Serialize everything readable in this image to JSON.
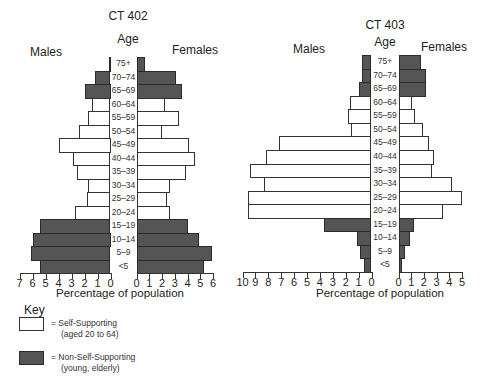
{
  "chart_data": [
    {
      "type": "bar",
      "subtype": "population-pyramid",
      "title": "CT 402",
      "center_label": "Age",
      "left_label": "Males",
      "right_label": "Females",
      "xlabel": "Percentage of population",
      "categories": [
        "75+",
        "70–74",
        "65–69",
        "60–64",
        "55–59",
        "50–54",
        "45–49",
        "40–44",
        "35–39",
        "30–34",
        "25–29",
        "20–24",
        "15–19",
        "10–14",
        "5–9",
        "<5"
      ],
      "category_type": [
        "non",
        "non",
        "non",
        "self",
        "self",
        "self",
        "self",
        "self",
        "self",
        "self",
        "self",
        "self",
        "non",
        "non",
        "non",
        "non"
      ],
      "series": [
        {
          "name": "Males",
          "values": [
            0.1,
            1.2,
            2.0,
            1.4,
            1.7,
            2.4,
            4.0,
            2.9,
            2.6,
            1.7,
            1.8,
            2.7,
            5.4,
            6.0,
            6.1,
            5.4
          ]
        },
        {
          "name": "Females",
          "values": [
            0.7,
            3.1,
            3.6,
            2.2,
            3.3,
            2.0,
            4.1,
            4.6,
            3.9,
            2.6,
            2.4,
            2.6,
            4.0,
            4.9,
            5.9,
            5.3
          ]
        }
      ],
      "left_axis": {
        "range": [
          7,
          0
        ],
        "ticks": [
          "7",
          "6",
          "5",
          "4",
          "3",
          "2",
          "1",
          "0"
        ]
      },
      "right_axis": {
        "range": [
          0,
          6
        ],
        "ticks": [
          "0",
          "1",
          "2",
          "3",
          "4",
          "5",
          "6"
        ]
      },
      "grid": false
    },
    {
      "type": "bar",
      "subtype": "population-pyramid",
      "title": "CT 403",
      "center_label": "Age",
      "left_label": "Males",
      "right_label": "Females",
      "xlabel": "Percentage of population",
      "categories": [
        "75+",
        "70–74",
        "65–69",
        "60–64",
        "55–59",
        "50–54",
        "45–49",
        "40–44",
        "35–39",
        "30–34",
        "25–29",
        "20–24",
        "15–19",
        "10–14",
        "5–9",
        "<5"
      ],
      "category_type": [
        "non",
        "non",
        "non",
        "self",
        "self",
        "self",
        "self",
        "self",
        "self",
        "self",
        "self",
        "self",
        "non",
        "non",
        "non",
        "non"
      ],
      "series": [
        {
          "name": "Males",
          "values": [
            0.7,
            0.7,
            1.0,
            1.7,
            1.8,
            1.6,
            7.2,
            8.2,
            9.4,
            8.3,
            9.6,
            9.6,
            3.7,
            1.1,
            0.9,
            0.6
          ]
        },
        {
          "name": "Females",
          "values": [
            1.8,
            2.2,
            2.2,
            1.1,
            1.3,
            1.9,
            2.4,
            2.8,
            2.6,
            4.2,
            5.0,
            3.5,
            1.2,
            0.9,
            0.5,
            0.3
          ]
        }
      ],
      "left_axis": {
        "range": [
          10,
          0
        ],
        "ticks": [
          "10",
          "9",
          "8",
          "7",
          "6",
          "5",
          "4",
          "3",
          "2",
          "1",
          "0"
        ]
      },
      "right_axis": {
        "range": [
          0,
          5
        ],
        "ticks": [
          "0",
          "1",
          "2",
          "3",
          "4",
          "5"
        ]
      },
      "grid": false
    }
  ],
  "key": {
    "title": "Key",
    "items": [
      {
        "id": "self",
        "line1": "= Self-Supporting",
        "line2": "(aged 20 to 64)",
        "color": "#ffffff"
      },
      {
        "id": "non",
        "line1": "= Non-Self-Supporting",
        "line2": "(young, elderly)",
        "color": "#555555"
      }
    ]
  }
}
